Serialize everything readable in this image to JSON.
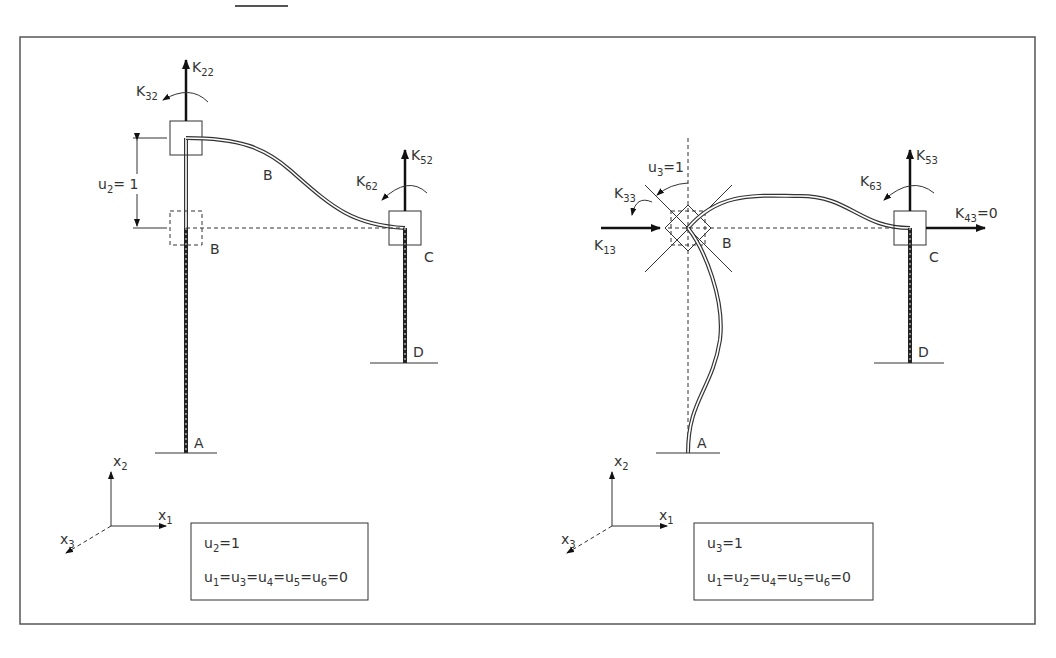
{
  "figure": {
    "top_rule": true,
    "border_color": "#555555",
    "panels": [
      {
        "id": "left",
        "forces": {
          "k22": "K",
          "k22_sub": "22",
          "k32": "K",
          "k32_sub": "32",
          "k52": "K",
          "k52_sub": "52",
          "k62": "K",
          "k62_sub": "62"
        },
        "displacement": {
          "u": "u",
          "u_sub": "2",
          "eq": "= 1"
        },
        "nodes": {
          "b_deformed": "B",
          "b_original": "B",
          "c": "C",
          "d": "D",
          "a": "A"
        },
        "axes": {
          "x1": "x",
          "x1_sub": "1",
          "x2": "x",
          "x2_sub": "2",
          "x3": "x",
          "x3_sub": "3"
        },
        "condition_box": {
          "line1": [
            "u",
            "2",
            "=1"
          ],
          "line2": [
            "u",
            "1",
            "=u",
            "3",
            "=u",
            "4",
            "=u",
            "5",
            "=u",
            "6",
            "=0"
          ]
        }
      },
      {
        "id": "right",
        "forces": {
          "k33": "K",
          "k33_sub": "33",
          "k13": "K",
          "k13_sub": "13",
          "k53": "K",
          "k53_sub": "53",
          "k63": "K",
          "k63_sub": "63",
          "k43": "K",
          "k43_sub": "43",
          "k43_val": "=0"
        },
        "rotation": {
          "u": "u",
          "u_sub": "3",
          "eq": "=1"
        },
        "nodes": {
          "b": "B",
          "c": "C",
          "d": "D",
          "a": "A"
        },
        "axes": {
          "x1": "x",
          "x1_sub": "1",
          "x2": "x",
          "x2_sub": "2",
          "x3": "x",
          "x3_sub": "3"
        },
        "condition_box": {
          "line1": [
            "u",
            "3",
            "=1"
          ],
          "line2": [
            "u",
            "1",
            "=u",
            "2",
            "=u",
            "4",
            "=u",
            "5",
            "=u",
            "6",
            "=0"
          ]
        }
      }
    ]
  }
}
